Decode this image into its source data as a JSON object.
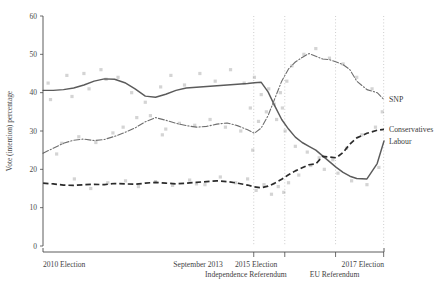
{
  "chart_data": {
    "type": "line",
    "title": "",
    "xlabel": "",
    "ylabel": "Vote (intention) percentage",
    "ylim": [
      0,
      60
    ],
    "yticks": [
      0,
      10,
      20,
      30,
      40,
      50,
      60
    ],
    "xlim": [
      0,
      100
    ],
    "grid": true,
    "grid_axis": "x",
    "legend_position": "right-inline",
    "xtick_labels": [
      {
        "label": "2010 Election",
        "x": 0,
        "row": 1
      },
      {
        "label": "September 2013",
        "x": 45.5,
        "row": 1
      },
      {
        "label": "2015 Election",
        "x": 62.5,
        "row": 1
      },
      {
        "label": "2017 Election",
        "x": 100,
        "row": 1
      },
      {
        "label": "Independence Referendum",
        "x": 59.5,
        "row": 2
      },
      {
        "label": "EU Referendum",
        "x": 85.5,
        "row": 2
      }
    ],
    "vlines": [
      {
        "label": "Independence Referendum",
        "x": 61.8
      },
      {
        "label": "2015 Election",
        "x": 70.9
      },
      {
        "label": "EU Referendum",
        "x": 85.8
      },
      {
        "label": "2017 Election",
        "x": 99.9
      }
    ],
    "series": [
      {
        "name": "Labour",
        "style": "solid",
        "color": "#5b5b5b",
        "x": [
          0,
          3,
          6,
          9,
          12,
          15,
          18,
          21,
          24,
          27,
          30,
          33,
          36,
          39,
          42,
          45,
          48,
          51,
          54,
          57,
          60,
          62,
          64,
          66,
          68,
          70,
          72,
          74,
          76,
          78,
          80,
          82,
          84,
          86,
          88,
          90,
          92,
          95,
          98,
          100
        ],
        "y": [
          40.6,
          40.6,
          40.8,
          41.2,
          42.0,
          43.0,
          43.6,
          43.5,
          42.6,
          41.0,
          39.1,
          38.8,
          39.6,
          40.6,
          41.2,
          41.4,
          41.6,
          41.8,
          42.0,
          42.2,
          42.4,
          42.6,
          42.7,
          40.2,
          36.5,
          33.0,
          30.5,
          28.4,
          27.0,
          26.0,
          25.0,
          23.5,
          22.0,
          20.5,
          19.2,
          18.2,
          17.6,
          17.5,
          21.5,
          27.4
        ]
      },
      {
        "name": "SNP",
        "style": "dashdot",
        "color": "#6f6f6f",
        "x": [
          0,
          3,
          6,
          9,
          12,
          15,
          18,
          21,
          24,
          27,
          30,
          33,
          36,
          39,
          42,
          45,
          48,
          51,
          54,
          57,
          60,
          62,
          64,
          66,
          68,
          70,
          72,
          74,
          76,
          78,
          80,
          82,
          84,
          86,
          88,
          90,
          92,
          95,
          98,
          100
        ],
        "y": [
          24.2,
          25.5,
          26.8,
          27.6,
          27.9,
          27.5,
          27.8,
          28.6,
          29.6,
          30.8,
          32.4,
          33.5,
          32.8,
          32.0,
          31.4,
          31.0,
          31.2,
          31.8,
          32.1,
          31.4,
          30.3,
          29.4,
          30.8,
          34.0,
          38.5,
          43.0,
          46.2,
          48.0,
          49.2,
          50.2,
          49.5,
          48.8,
          48.6,
          48.0,
          47.3,
          46.0,
          43.0,
          40.8,
          40.0,
          38.2
        ]
      },
      {
        "name": "Conservatives",
        "style": "dashed",
        "color": "#2b2b2b",
        "x": [
          0,
          3,
          6,
          9,
          12,
          15,
          18,
          21,
          24,
          27,
          30,
          33,
          36,
          39,
          42,
          45,
          48,
          51,
          54,
          57,
          60,
          62,
          64,
          66,
          68,
          70,
          72,
          74,
          76,
          78,
          80,
          82,
          84,
          86,
          88,
          90,
          92,
          95,
          98,
          100
        ],
        "y": [
          16.4,
          16.2,
          15.9,
          15.8,
          16.0,
          16.1,
          16.0,
          16.3,
          16.2,
          16.1,
          16.4,
          16.6,
          16.4,
          16.2,
          16.4,
          16.6,
          16.8,
          17.0,
          16.8,
          16.4,
          15.9,
          15.4,
          15.2,
          15.6,
          16.4,
          17.4,
          18.6,
          19.6,
          20.4,
          21.2,
          21.4,
          23.4,
          23.2,
          23.0,
          24.4,
          26.6,
          28.2,
          29.4,
          30.2,
          30.4
        ]
      }
    ],
    "scatter_note": "Individual poll observations plotted as light grey semi-transparent squares",
    "scatter": [
      {
        "x": 1.5,
        "y": 42.5
      },
      {
        "x": 2.2,
        "y": 38.2
      },
      {
        "x": 4.0,
        "y": 24.0
      },
      {
        "x": 5.5,
        "y": 26.8
      },
      {
        "x": 7.0,
        "y": 44.5
      },
      {
        "x": 8.5,
        "y": 39.0
      },
      {
        "x": 9.2,
        "y": 17.5
      },
      {
        "x": 10.5,
        "y": 28.5
      },
      {
        "x": 12.0,
        "y": 45.0
      },
      {
        "x": 13.5,
        "y": 41.0
      },
      {
        "x": 14.0,
        "y": 15.0
      },
      {
        "x": 15.5,
        "y": 27.0
      },
      {
        "x": 17.0,
        "y": 46.0
      },
      {
        "x": 18.5,
        "y": 43.5
      },
      {
        "x": 19.0,
        "y": 16.5
      },
      {
        "x": 20.5,
        "y": 29.5
      },
      {
        "x": 22.0,
        "y": 44.0
      },
      {
        "x": 23.5,
        "y": 31.0
      },
      {
        "x": 24.2,
        "y": 17.0
      },
      {
        "x": 26.0,
        "y": 40.0
      },
      {
        "x": 27.5,
        "y": 33.5
      },
      {
        "x": 28.0,
        "y": 15.5
      },
      {
        "x": 30.0,
        "y": 37.5
      },
      {
        "x": 31.5,
        "y": 34.0
      },
      {
        "x": 33.0,
        "y": 16.8
      },
      {
        "x": 34.5,
        "y": 41.5
      },
      {
        "x": 36.0,
        "y": 30.5
      },
      {
        "x": 37.5,
        "y": 44.5
      },
      {
        "x": 38.0,
        "y": 15.8
      },
      {
        "x": 40.0,
        "y": 32.0
      },
      {
        "x": 41.5,
        "y": 42.0
      },
      {
        "x": 43.0,
        "y": 17.2
      },
      {
        "x": 44.5,
        "y": 31.5
      },
      {
        "x": 46.0,
        "y": 45.0
      },
      {
        "x": 47.5,
        "y": 16.0
      },
      {
        "x": 49.0,
        "y": 33.0
      },
      {
        "x": 50.5,
        "y": 43.0
      },
      {
        "x": 52.0,
        "y": 18.0
      },
      {
        "x": 53.5,
        "y": 31.0
      },
      {
        "x": 55.0,
        "y": 46.0
      },
      {
        "x": 56.5,
        "y": 16.5
      },
      {
        "x": 58.0,
        "y": 30.0
      },
      {
        "x": 59.0,
        "y": 42.5
      },
      {
        "x": 60.0,
        "y": 17.5
      },
      {
        "x": 60.8,
        "y": 36.0
      },
      {
        "x": 61.5,
        "y": 25.0
      },
      {
        "x": 62.0,
        "y": 44.0
      },
      {
        "x": 62.5,
        "y": 14.5
      },
      {
        "x": 63.2,
        "y": 32.5
      },
      {
        "x": 64.0,
        "y": 39.5
      },
      {
        "x": 64.8,
        "y": 16.0
      },
      {
        "x": 65.5,
        "y": 35.0
      },
      {
        "x": 66.2,
        "y": 41.0
      },
      {
        "x": 67.0,
        "y": 13.5
      },
      {
        "x": 67.8,
        "y": 37.0
      },
      {
        "x": 68.5,
        "y": 33.0
      },
      {
        "x": 69.0,
        "y": 15.5
      },
      {
        "x": 69.6,
        "y": 40.0
      },
      {
        "x": 70.2,
        "y": 36.0
      },
      {
        "x": 70.6,
        "y": 14.0
      },
      {
        "x": 71.0,
        "y": 30.0
      },
      {
        "x": 71.5,
        "y": 43.0
      },
      {
        "x": 72.0,
        "y": 16.5
      },
      {
        "x": 73.0,
        "y": 47.0
      },
      {
        "x": 74.0,
        "y": 26.0
      },
      {
        "x": 75.0,
        "y": 18.5
      },
      {
        "x": 76.5,
        "y": 50.0
      },
      {
        "x": 77.5,
        "y": 24.5
      },
      {
        "x": 78.5,
        "y": 21.0
      },
      {
        "x": 80.0,
        "y": 51.5
      },
      {
        "x": 81.0,
        "y": 23.0
      },
      {
        "x": 82.5,
        "y": 20.0
      },
      {
        "x": 84.0,
        "y": 49.0
      },
      {
        "x": 85.0,
        "y": 22.5
      },
      {
        "x": 86.5,
        "y": 19.0
      },
      {
        "x": 88.0,
        "y": 47.5
      },
      {
        "x": 89.0,
        "y": 25.5
      },
      {
        "x": 90.5,
        "y": 17.0
      },
      {
        "x": 92.0,
        "y": 44.0
      },
      {
        "x": 93.5,
        "y": 29.0
      },
      {
        "x": 95.0,
        "y": 16.0
      },
      {
        "x": 96.5,
        "y": 41.0
      },
      {
        "x": 97.5,
        "y": 31.0
      },
      {
        "x": 98.5,
        "y": 20.5
      },
      {
        "x": 99.5,
        "y": 35.0
      },
      {
        "x": 45.0,
        "y": 16.2
      },
      {
        "x": 35.0,
        "y": 29.0
      }
    ]
  }
}
